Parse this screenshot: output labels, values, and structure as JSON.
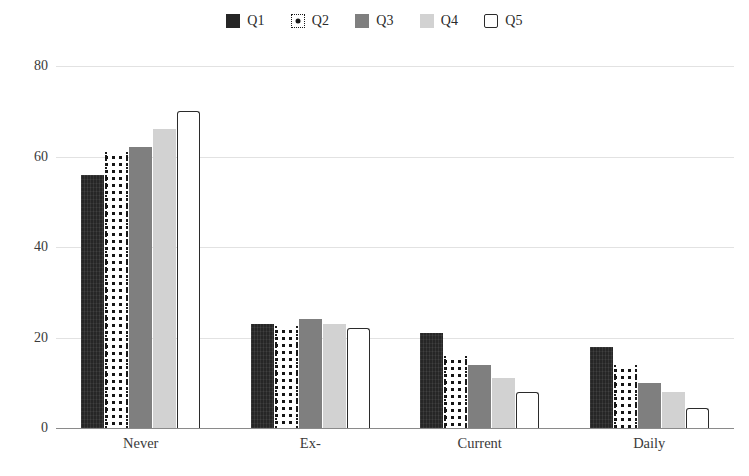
{
  "chart_data": {
    "type": "bar",
    "title": "",
    "xlabel": "",
    "ylabel": "",
    "categories": [
      "Never",
      "Ex-",
      "Current",
      "Daily"
    ],
    "series": [
      {
        "name": "Q1",
        "values": [
          56,
          23,
          21,
          18
        ],
        "swatch": "solid-dark-square-icon",
        "color": "#262626"
      },
      {
        "name": "Q2",
        "values": [
          61,
          22.5,
          16,
          14
        ],
        "swatch": "dotted-square-icon",
        "color": "#ffffff"
      },
      {
        "name": "Q3",
        "values": [
          62,
          24,
          14,
          10
        ],
        "swatch": "solid-gray-square-icon",
        "color": "#7f7f7f"
      },
      {
        "name": "Q4",
        "values": [
          66,
          23,
          11,
          8
        ],
        "swatch": "solid-light-gray-square-icon",
        "color": "#d2d2d2"
      },
      {
        "name": "Q5",
        "values": [
          70,
          22,
          8,
          4.5
        ],
        "swatch": "outline-square-icon",
        "color": "#ffffff"
      }
    ],
    "ylim": [
      0,
      80
    ],
    "yticks": [
      0,
      20,
      40,
      60,
      80
    ],
    "ytick_labels": [
      "0",
      "20",
      "40",
      "60",
      "80"
    ],
    "grid": true,
    "legend_position": "top-center",
    "gridline_color": "#e2e2e2",
    "axis_color": "#8a8a8a",
    "background": "#ffffff"
  }
}
